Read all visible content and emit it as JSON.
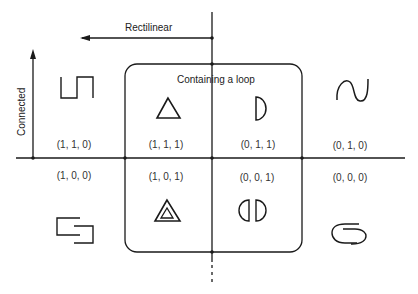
{
  "axes": {
    "rectilinear_label": "Rectilinear",
    "connected_label": "Connected",
    "loop_region_label": "Containing a loop"
  },
  "quadrants": [
    {
      "code": "(1, 1, 0)",
      "shape": "square-wave",
      "rectilinear": 1,
      "connected": 1,
      "loop": 0
    },
    {
      "code": "(1, 1, 1)",
      "shape": "triangle",
      "rectilinear": 1,
      "connected": 1,
      "loop": 1
    },
    {
      "code": "(0, 1, 1)",
      "shape": "d-shape",
      "rectilinear": 0,
      "connected": 1,
      "loop": 1
    },
    {
      "code": "(0, 1, 0)",
      "shape": "sine-wave",
      "rectilinear": 0,
      "connected": 1,
      "loop": 0
    },
    {
      "code": "(1, 0, 0)",
      "shape": "interlocked-brackets",
      "rectilinear": 1,
      "connected": 0,
      "loop": 0
    },
    {
      "code": "(1, 0, 1)",
      "shape": "nested-triangles",
      "rectilinear": 1,
      "connected": 0,
      "loop": 1
    },
    {
      "code": "(0, 0, 1)",
      "shape": "split-circle",
      "rectilinear": 0,
      "connected": 0,
      "loop": 1
    },
    {
      "code": "(0, 0, 0)",
      "shape": "interlocked-curves",
      "rectilinear": 0,
      "connected": 0,
      "loop": 0
    }
  ],
  "colors": {
    "stroke": "#1a1a1a",
    "background": "#ffffff"
  }
}
